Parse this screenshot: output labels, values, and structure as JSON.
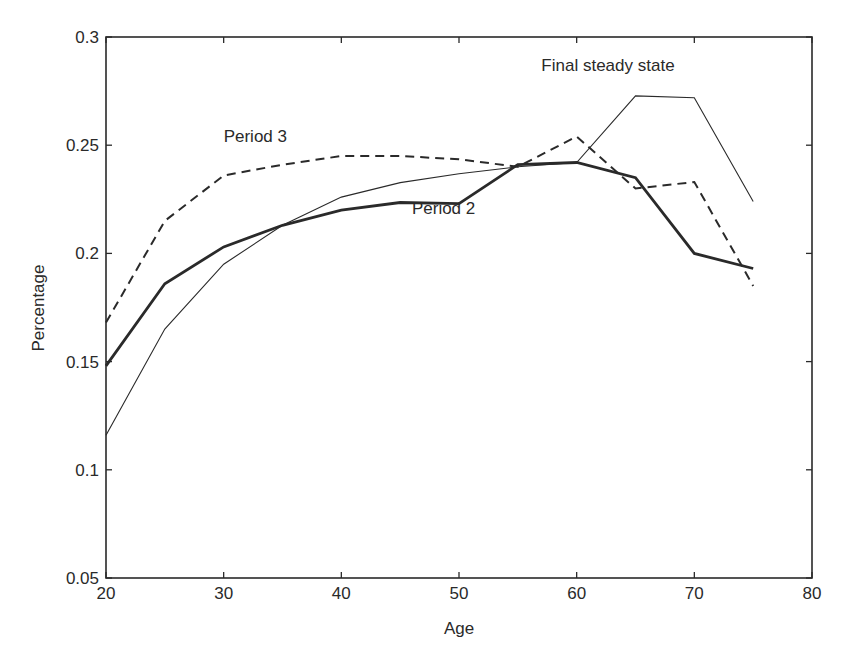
{
  "chart_data": {
    "type": "line",
    "title": "",
    "xlabel": "Age",
    "ylabel": "Percentage",
    "xlim": [
      20,
      80
    ],
    "ylim": [
      0.05,
      0.3
    ],
    "xticks": [
      20,
      30,
      40,
      50,
      60,
      70,
      80
    ],
    "yticks": [
      0.05,
      0.1,
      0.15,
      0.2,
      0.25,
      0.3
    ],
    "xtick_labels": [
      "20",
      "30",
      "40",
      "50",
      "60",
      "70",
      "80"
    ],
    "ytick_labels": [
      "0.05",
      "0.1",
      "0.15",
      "0.2",
      "0.25",
      "0.3"
    ],
    "grid": false,
    "legend": "none (inline annotations)",
    "x": [
      20,
      25,
      30,
      35,
      40,
      45,
      50,
      55,
      60,
      65,
      70,
      75
    ],
    "series": [
      {
        "name": "Period 2",
        "style": "solid-thick",
        "values": [
          0.148,
          0.186,
          0.203,
          0.213,
          0.22,
          0.2235,
          0.223,
          0.241,
          0.242,
          0.235,
          0.2,
          0.193
        ]
      },
      {
        "name": "Period 3",
        "style": "dashed",
        "values": [
          0.168,
          0.215,
          0.236,
          0.241,
          0.245,
          0.245,
          0.2435,
          0.24,
          0.254,
          0.23,
          0.233,
          0.185
        ]
      },
      {
        "name": "Final steady state",
        "style": "solid-thin",
        "values": [
          0.116,
          0.165,
          0.195,
          0.213,
          0.226,
          0.2327,
          0.2368,
          0.24,
          0.242,
          0.2728,
          0.2719,
          0.224
        ]
      }
    ],
    "annotations": [
      {
        "text": "Period 3",
        "x": 30,
        "y": 0.2515
      },
      {
        "text": "Period 2",
        "x": 46,
        "y": 0.218
      },
      {
        "text": "Final steady state",
        "x": 57,
        "y": 0.2845
      }
    ]
  },
  "colors": {
    "ink": "#2a2a2a",
    "background": "#ffffff"
  }
}
